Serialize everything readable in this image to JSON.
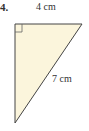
{
  "problem": {
    "number": "4.",
    "shape": "right-triangle",
    "fill_color": "#fbf5dc",
    "stroke_color": "#444444",
    "sides": {
      "top_leg": "4 cm",
      "hypotenuse": "7 cm"
    },
    "right_angle_marker": true
  }
}
